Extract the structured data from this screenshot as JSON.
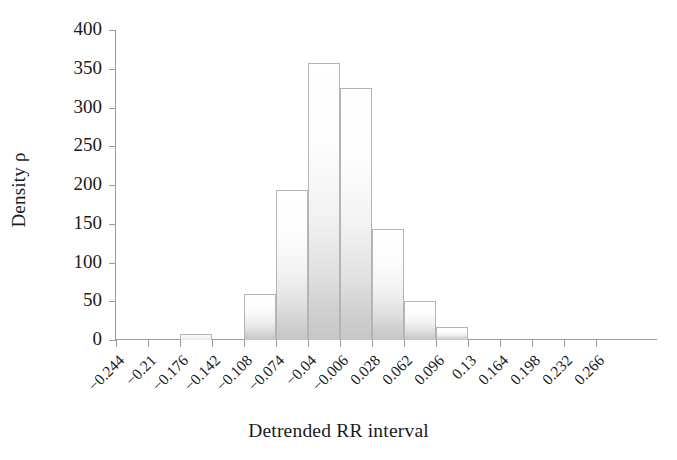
{
  "chart_data": {
    "type": "bar",
    "title": "",
    "subtitle": "",
    "xlabel": "Detrended RR interval",
    "ylabel": "Density ρ",
    "grid": false,
    "legend": null,
    "ylim": [
      0,
      400
    ],
    "yticks": [
      0,
      50,
      100,
      150,
      200,
      250,
      300,
      350,
      400
    ],
    "ytick_labels": [
      "0",
      "50",
      "100",
      "150",
      "200",
      "250",
      "300",
      "350",
      "400"
    ],
    "xtick_labels": [
      "−0.244",
      "−0.21",
      "−0.176",
      "−0.142",
      "−0.108",
      "−0.074",
      "−0.04",
      "−0.006",
      "0.028",
      "0.062",
      "0.096",
      "0.13",
      "0.164",
      "0.198",
      "0.232",
      "0.266"
    ],
    "bin_width": 0.034,
    "categories": [
      "−0.244",
      "−0.21",
      "−0.176",
      "−0.142",
      "−0.108",
      "−0.074",
      "−0.04",
      "−0.006",
      "0.028",
      "0.062",
      "0.096",
      "0.13",
      "0.164",
      "0.198",
      "0.232",
      "0.266"
    ],
    "values": [
      0,
      0,
      8,
      0,
      59,
      193,
      358,
      325,
      143,
      50,
      17,
      0,
      0,
      0,
      0,
      0
    ],
    "bars": [
      {
        "bin_start": "−0.244",
        "value": 0
      },
      {
        "bin_start": "−0.21",
        "value": 0
      },
      {
        "bin_start": "−0.176",
        "value": 8
      },
      {
        "bin_start": "−0.142",
        "value": 0
      },
      {
        "bin_start": "−0.108",
        "value": 59
      },
      {
        "bin_start": "−0.074",
        "value": 193
      },
      {
        "bin_start": "−0.04",
        "value": 358
      },
      {
        "bin_start": "−0.006",
        "value": 325
      },
      {
        "bin_start": "0.028",
        "value": 143
      },
      {
        "bin_start": "0.062",
        "value": 50
      },
      {
        "bin_start": "0.096",
        "value": 17
      },
      {
        "bin_start": "0.13",
        "value": 0
      },
      {
        "bin_start": "0.164",
        "value": 0
      },
      {
        "bin_start": "0.198",
        "value": 0
      },
      {
        "bin_start": "0.232",
        "value": 0
      },
      {
        "bin_start": "0.266",
        "value": 0
      }
    ],
    "colors": {
      "bar_top": "#ffffff",
      "bar_bottom": "#c6c6c6",
      "bar_border": "#b4b4b4",
      "axis": "#9a9a9a",
      "text": "#1a1a1a",
      "background": "#ffffff"
    }
  }
}
